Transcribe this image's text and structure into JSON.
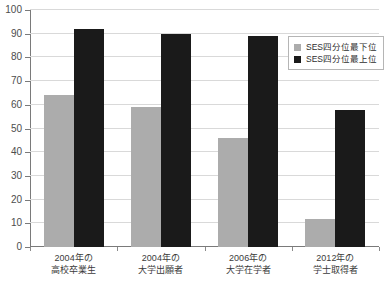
{
  "chart_data": {
    "type": "bar",
    "title": "",
    "subtitle": "",
    "xlabel": "",
    "ylabel": "",
    "ylim": [
      0,
      100
    ],
    "ytick_step": 10,
    "yticks": [
      "0",
      "10",
      "20",
      "30",
      "40",
      "50",
      "60",
      "70",
      "80",
      "90",
      "100"
    ],
    "grid": true,
    "legend_position": "upper-right",
    "categories": [
      "2004年の\n高校卒業生",
      "2004年の\n大学出願者",
      "2006年の\n大学在学者",
      "2012年の\n学士取得者"
    ],
    "category_lines": [
      {
        "line1": "2004年の",
        "line2": "高校卒業生"
      },
      {
        "line1": "2004年の",
        "line2": "大学出願者"
      },
      {
        "line1": "2006年の",
        "line2": "大学在学者"
      },
      {
        "line1": "2012年の",
        "line2": "学士取得者"
      }
    ],
    "series": [
      {
        "name": "SES四分位最下位",
        "color": "#acacac",
        "values": [
          64,
          59,
          46,
          12
        ]
      },
      {
        "name": "SES四分位最上位",
        "color": "#1a1a1a",
        "values": [
          92,
          90,
          89,
          58
        ]
      }
    ]
  },
  "legend": {
    "items": [
      {
        "label": "SES四分位最下位",
        "swatch": "low"
      },
      {
        "label": "SES四分位最上位",
        "swatch": "high"
      }
    ]
  },
  "colors": {
    "series_low": "#acacac",
    "series_high": "#1a1a1a",
    "gridline": "#d9d9d9",
    "axis": "#7a7a7a",
    "tick_text": "#4d4d4d",
    "background": "#ffffff"
  }
}
